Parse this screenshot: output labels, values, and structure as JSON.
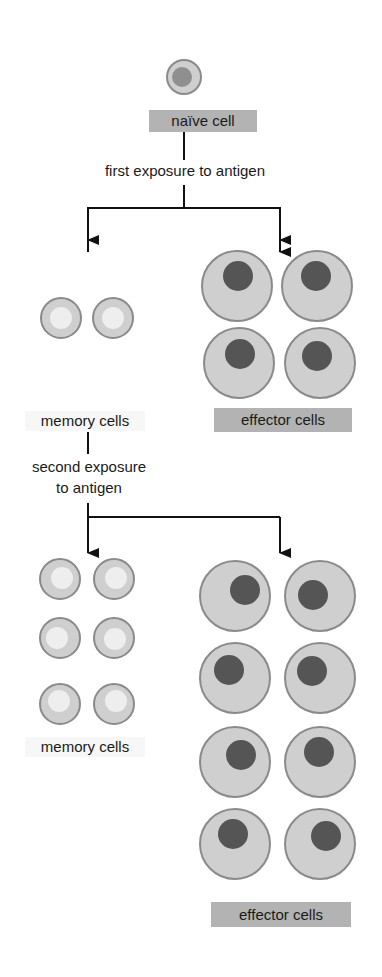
{
  "diagram": {
    "nodes": {
      "naive": {
        "label": "naïve cell"
      },
      "first_exposure": {
        "label": "first exposure to antigen"
      },
      "memory1": {
        "label": "memory cells",
        "count": 2
      },
      "effector1": {
        "label": "effector cells",
        "count": 4
      },
      "second_exposure": {
        "label_line1": "second exposure",
        "label_line2": "to antigen"
      },
      "memory2": {
        "label": "memory cells",
        "count": 6
      },
      "effector2": {
        "label": "effector cells",
        "count": 8
      }
    },
    "colors": {
      "label_box": "#b3b3b3",
      "membrane": "#8a8a8a",
      "cytoplasm": "#cfcfcf",
      "effector_nucleus": "#555555",
      "memory_nucleus": "#eeeeee",
      "naive_nucleus": "#8f8f8f",
      "line": "#111111"
    }
  }
}
